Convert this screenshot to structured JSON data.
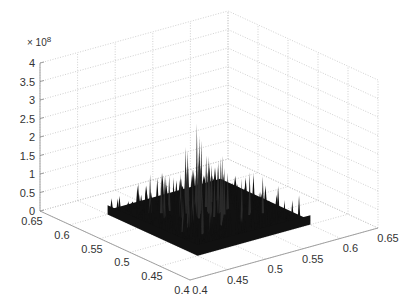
{
  "chart_data": {
    "type": "surface3d",
    "title": "",
    "xlabel": "",
    "ylabel": "",
    "zlabel": "",
    "z_multiplier": "× 10^8",
    "z_multiplier_base": "× 10",
    "z_multiplier_exp": "8",
    "xlim": [
      0.4,
      0.65
    ],
    "ylim": [
      0.4,
      0.65
    ],
    "zlim": [
      0,
      4
    ],
    "x_ticks": [
      "0.4",
      "0.45",
      "0.5",
      "0.55",
      "0.6",
      "0.65"
    ],
    "y_ticks": [
      "0.4",
      "0.45",
      "0.5",
      "0.55",
      "0.6",
      "0.65"
    ],
    "z_ticks": [
      "0",
      "0.5",
      "1",
      "1.5",
      "2",
      "2.5",
      "3",
      "3.5",
      "4"
    ],
    "grid": true,
    "grid_style": "dotted",
    "surface_color": "#111111",
    "surface_extent": {
      "x": [
        0.45,
        0.6
      ],
      "y": [
        0.45,
        0.6
      ]
    },
    "peak_max_estimate": 2.6,
    "spikes": [
      {
        "u": 0.55,
        "v": 0.42,
        "h": 2.6
      },
      {
        "u": 0.58,
        "v": 0.47,
        "h": 2.2
      },
      {
        "u": 0.5,
        "v": 0.4,
        "h": 1.9
      },
      {
        "u": 0.62,
        "v": 0.52,
        "h": 2.0
      },
      {
        "u": 0.4,
        "v": 0.55,
        "h": 1.8
      },
      {
        "u": 0.48,
        "v": 0.6,
        "h": 1.6
      },
      {
        "u": 0.7,
        "v": 0.45,
        "h": 1.7
      },
      {
        "u": 0.66,
        "v": 0.6,
        "h": 1.5
      },
      {
        "u": 0.35,
        "v": 0.4,
        "h": 1.4
      },
      {
        "u": 0.28,
        "v": 0.45,
        "h": 1.2
      },
      {
        "u": 0.2,
        "v": 0.35,
        "h": 1.0
      },
      {
        "u": 0.72,
        "v": 0.7,
        "h": 1.1
      },
      {
        "u": 0.6,
        "v": 0.3,
        "h": 1.3
      },
      {
        "u": 0.45,
        "v": 0.3,
        "h": 1.35
      },
      {
        "u": 0.78,
        "v": 0.55,
        "h": 0.9
      },
      {
        "u": 0.3,
        "v": 0.62,
        "h": 1.0
      },
      {
        "u": 0.52,
        "v": 0.7,
        "h": 1.1
      },
      {
        "u": 0.15,
        "v": 0.25,
        "h": 0.8
      },
      {
        "u": 0.85,
        "v": 0.8,
        "h": 0.6
      },
      {
        "u": 0.4,
        "v": 0.22,
        "h": 1.2
      },
      {
        "u": 0.64,
        "v": 0.38,
        "h": 1.9
      },
      {
        "u": 0.57,
        "v": 0.55,
        "h": 1.6
      },
      {
        "u": 0.33,
        "v": 0.3,
        "h": 1.1
      },
      {
        "u": 0.75,
        "v": 0.35,
        "h": 1.0
      }
    ]
  }
}
